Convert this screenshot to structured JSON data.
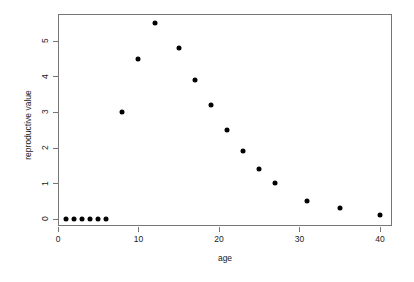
{
  "chart_data": {
    "type": "scatter",
    "title": "",
    "xlabel": "age",
    "ylabel": "reproductive value",
    "x": [
      1,
      2,
      3,
      4,
      5,
      6,
      8,
      10,
      12,
      15,
      17,
      19,
      21,
      23,
      25,
      27,
      31,
      35,
      40
    ],
    "values": [
      0,
      0,
      0,
      0,
      0,
      0,
      3.0,
      4.5,
      5.5,
      4.8,
      3.9,
      3.2,
      2.5,
      1.9,
      1.4,
      1.0,
      0.5,
      0.3,
      0.1
    ],
    "xlim": [
      0,
      41.5
    ],
    "ylim": [
      -0.2,
      5.75
    ],
    "xticks": [
      0,
      10,
      20,
      30,
      40
    ],
    "xtick_labels": [
      "0",
      "10",
      "20",
      "30",
      "40"
    ],
    "yticks": [
      0,
      1,
      2,
      3,
      4,
      5
    ],
    "ytick_labels": [
      "0",
      "1",
      "2",
      "3",
      "4",
      "5"
    ],
    "grid": false,
    "legend": null,
    "marker": "filled-circle",
    "marker_color": "#000000",
    "frame_color": "#767676"
  }
}
